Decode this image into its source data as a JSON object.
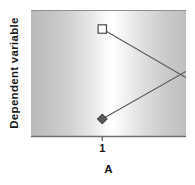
{
  "chart_data": {
    "type": "line",
    "title": "",
    "subtitle": "",
    "xlabel": "A",
    "ylabel": "Dependent variable",
    "categories": [
      "1",
      "2"
    ],
    "x": [
      1,
      2
    ],
    "xlim": [
      0.54,
      1.54
    ],
    "ylim": [
      0,
      1
    ],
    "grid": false,
    "legend": null,
    "legend_position": "none",
    "annotations": [],
    "series": [
      {
        "name": "open-square-series",
        "marker": "open-square",
        "marker_fill": "#ffffff",
        "marker_edge": "#4a4a4a",
        "line_color": "#5a5a5a",
        "values": [
          0.857,
          0.143
        ],
        "points": [
          {
            "x": 1,
            "y": 0.857
          },
          {
            "x": 2,
            "y": 0.143
          }
        ]
      },
      {
        "name": "filled-diamond-series",
        "marker": "filled-diamond",
        "marker_fill": "#595959",
        "marker_edge": "#3c3c3c",
        "line_color": "#5a5a5a",
        "values": [
          0.143,
          0.841
        ],
        "points": [
          {
            "x": 1,
            "y": 0.143
          },
          {
            "x": 2,
            "y": 0.841
          }
        ]
      }
    ],
    "colors": {
      "panel_edge": "#b9b9b9",
      "panel_center": "#fefefe",
      "axis": "#6e6e6e",
      "text": "#141414"
    }
  },
  "axes": {
    "x": {
      "label": "A",
      "ticks": [
        {
          "label": "1",
          "value": 1
        },
        {
          "label": "2",
          "value": 2
        }
      ]
    },
    "y": {
      "label": "Dependent variable",
      "ticks": []
    }
  }
}
